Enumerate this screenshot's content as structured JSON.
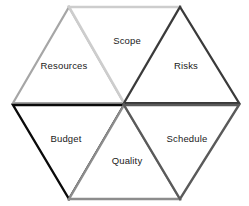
{
  "diagram": {
    "type": "hexagon-six-triangles",
    "background_color": "#ffffff",
    "center": {
      "x": 124,
      "y": 103
    },
    "hexagon_vertices": [
      {
        "x": 13,
        "y": 103
      },
      {
        "x": 69,
        "y": 7
      },
      {
        "x": 180,
        "y": 7
      },
      {
        "x": 239,
        "y": 103
      },
      {
        "x": 180,
        "y": 199
      },
      {
        "x": 69,
        "y": 199
      }
    ],
    "segments": [
      {
        "id": "resources",
        "label": "Resources",
        "orientation": "up",
        "position": "upper-left",
        "stroke_color": "#a6a6a6",
        "stroke_width": 2.2,
        "fill_color": "#ffffff",
        "points": "13,103 69,7 124,103",
        "label_x": 64,
        "label_y": 66
      },
      {
        "id": "scope",
        "label": "Scope",
        "orientation": "down",
        "position": "top-center",
        "stroke_color": "#cdcdcd",
        "stroke_width": 2.6,
        "fill_color": "#ffffff",
        "points": "69,7 180,7 124,103",
        "label_x": 127,
        "label_y": 41
      },
      {
        "id": "risks",
        "label": "Risks",
        "orientation": "up",
        "position": "upper-right",
        "stroke_color": "#3a3a3a",
        "stroke_width": 2.2,
        "fill_color": "#ffffff",
        "points": "124,103 180,7 239,103",
        "label_x": 186,
        "label_y": 66
      },
      {
        "id": "budget",
        "label": "Budget",
        "orientation": "down",
        "position": "lower-left",
        "stroke_color": "#0a0a0a",
        "stroke_width": 2.4,
        "fill_color": "#ffffff",
        "points": "13,105 124,105 69,199",
        "label_x": 66,
        "label_y": 139
      },
      {
        "id": "quality",
        "label": "Quality",
        "orientation": "up",
        "position": "bottom-center",
        "stroke_color": "#8c8c8c",
        "stroke_width": 2.4,
        "fill_color": "#ffffff",
        "points": "69,199 124,105 180,199",
        "label_x": 127,
        "label_y": 161
      },
      {
        "id": "schedule",
        "label": "Schedule",
        "orientation": "down",
        "position": "lower-right",
        "stroke_color": "#5a5a5a",
        "stroke_width": 2.4,
        "fill_color": "#ffffff",
        "points": "124,105 239,105 180,199",
        "label_x": 187,
        "label_y": 139
      }
    ]
  }
}
